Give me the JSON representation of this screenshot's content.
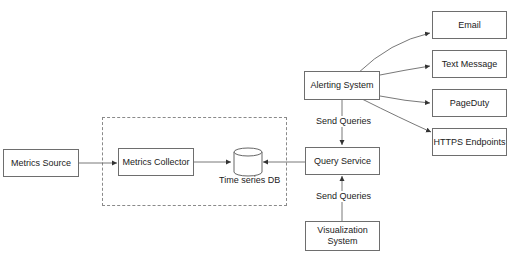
{
  "diagram": {
    "type": "flowchart",
    "title": "",
    "group": {
      "name": "data-collection-group",
      "style": "dashed"
    },
    "nodes": [
      {
        "id": "metrics_source",
        "label": "Metrics Source"
      },
      {
        "id": "metrics_collector",
        "label": "Metrics Collector"
      },
      {
        "id": "tsdb",
        "label": "Time series DB",
        "shape": "cylinder"
      },
      {
        "id": "query_service",
        "label": "Query Service"
      },
      {
        "id": "alerting",
        "label": "Alerting System"
      },
      {
        "id": "visualization",
        "label": "Visualization System",
        "line1": "Visualization",
        "line2": "System"
      },
      {
        "id": "email",
        "label": "Email"
      },
      {
        "id": "sms",
        "label": "Text Message"
      },
      {
        "id": "pagerduty",
        "label": "PageDuty"
      },
      {
        "id": "https",
        "label": "HTTPS Endpoints"
      }
    ],
    "edges": [
      {
        "from": "metrics_source",
        "to": "metrics_collector",
        "label": ""
      },
      {
        "from": "metrics_collector",
        "to": "tsdb",
        "label": ""
      },
      {
        "from": "query_service",
        "to": "tsdb",
        "label": ""
      },
      {
        "from": "alerting",
        "to": "query_service",
        "label": "Send Queries"
      },
      {
        "from": "visualization",
        "to": "query_service",
        "label": "Send Queries"
      },
      {
        "from": "alerting",
        "to": "email",
        "label": ""
      },
      {
        "from": "alerting",
        "to": "sms",
        "label": ""
      },
      {
        "from": "alerting",
        "to": "pagerduty",
        "label": ""
      },
      {
        "from": "alerting",
        "to": "https",
        "label": ""
      }
    ],
    "edge_labels": {
      "alert_to_query": "Send Queries",
      "vis_to_query": "Send Queries"
    }
  }
}
